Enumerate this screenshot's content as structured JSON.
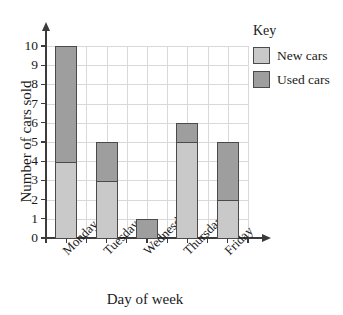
{
  "chart_data": {
    "type": "bar",
    "stacked": true,
    "title": "",
    "xlabel": "Day of week",
    "ylabel": "Number of cars sold",
    "categories": [
      "Monday",
      "Tuesday",
      "Wednesday",
      "Thursday",
      "Friday"
    ],
    "series": [
      {
        "name": "New cars",
        "color": "#c9c9c9",
        "values": [
          4,
          3,
          0,
          5,
          2
        ]
      },
      {
        "name": "Used cars",
        "color": "#9e9e9e",
        "values": [
          6,
          2,
          1,
          1,
          3
        ]
      }
    ],
    "totals": [
      10,
      5,
      1,
      6,
      5
    ],
    "ylim": [
      0,
      10
    ],
    "ytick_labels": [
      "0",
      "1",
      "2",
      "3",
      "4",
      "5",
      "6",
      "7",
      "8",
      "9",
      "10"
    ],
    "ytick_step": 1,
    "grid": true,
    "legend": {
      "title": "Key",
      "position": "top-right",
      "entries": [
        {
          "label": "New cars",
          "color": "#c9c9c9"
        },
        {
          "label": "Used cars",
          "color": "#9e9e9e"
        }
      ]
    },
    "axis_arrows": true
  },
  "colors": {
    "new_cars": "#c9c9c9",
    "used_cars": "#9e9e9e",
    "axis": "#3b3b3b",
    "grid": "#d9d9d9",
    "bar_outline": "#4a4a4a",
    "background": "#ffffff"
  }
}
